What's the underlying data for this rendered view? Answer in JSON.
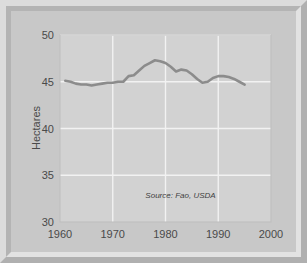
{
  "figure": {
    "background_color": "#c8c8c8",
    "plot_background_color": "#d2d2d2",
    "frame_light_color": "#dcdcdc",
    "frame_dark_color": "#b0b0b0"
  },
  "annotation": {
    "source_label": "Source: Fao, USDA"
  },
  "chart_data": {
    "type": "line",
    "title": "",
    "subtitle": "",
    "xlabel": "",
    "ylabel": "Hectares",
    "xlim": [
      1960,
      2000
    ],
    "ylim": [
      30,
      50
    ],
    "xticks": [
      1960,
      1970,
      1980,
      1990,
      2000
    ],
    "xtick_labels": [
      "1960",
      "1970",
      "1980",
      "1990",
      "2000"
    ],
    "yticks": [
      30,
      35,
      40,
      45,
      50
    ],
    "ytick_labels": [
      "30",
      "35",
      "40",
      "45",
      "50"
    ],
    "grid": true,
    "grid_color": "#f2f2f2",
    "legend": false,
    "legend_position": "none",
    "line_color": "#8c8c8c",
    "line_width": 2.6,
    "annotations": [
      {
        "text": "Source: Fao, USDA",
        "x": 1989.5,
        "y": 32.6,
        "style": "italic"
      }
    ],
    "series": [
      {
        "name": "Hectares",
        "x": [
          1961,
          1962,
          1963,
          1964,
          1965,
          1966,
          1967,
          1968,
          1969,
          1970,
          1971,
          1972,
          1973,
          1974,
          1975,
          1976,
          1977,
          1978,
          1979,
          1980,
          1981,
          1982,
          1983,
          1984,
          1985,
          1986,
          1987,
          1988,
          1989,
          1990,
          1991,
          1992,
          1993,
          1994,
          1995
        ],
        "values": [
          45.1,
          45.0,
          44.8,
          44.7,
          44.7,
          44.6,
          44.7,
          44.8,
          44.9,
          44.9,
          45.0,
          45.0,
          45.6,
          45.7,
          46.2,
          46.7,
          47.0,
          47.3,
          47.2,
          47.0,
          46.6,
          46.1,
          46.3,
          46.2,
          45.8,
          45.3,
          44.9,
          45.0,
          45.4,
          45.6,
          45.6,
          45.5,
          45.3,
          45.0,
          44.7
        ]
      }
    ]
  }
}
